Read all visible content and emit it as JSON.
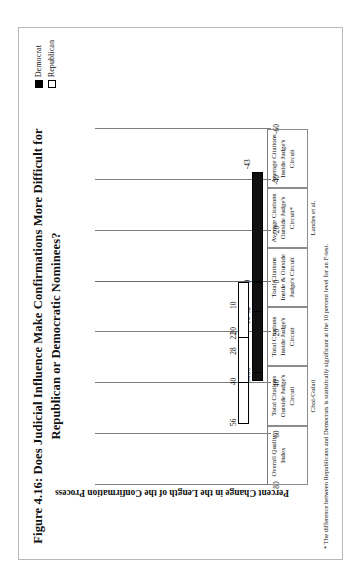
{
  "figure": {
    "title": "Figure 4.16: Does Judicial Influence Make Confirmations More Difficult for Republican or Democratic Nominees?",
    "footnote": "* The difference between Republicans and Democrats is statistically significant at the 10 percent level for an F-test."
  },
  "legend": {
    "items": [
      {
        "label": "Democrat",
        "swatch": "filled-square-icon",
        "color": "#000000"
      },
      {
        "label": "Republican",
        "swatch": "hollow-square-icon",
        "color": "#ffffff"
      }
    ]
  },
  "axis": {
    "ylabel": "Percent Change in the Length of the Confirmation Process",
    "ticks": [
      "80",
      "60",
      "40",
      "20",
      "0",
      "-20",
      "-40",
      "-60"
    ]
  },
  "groups": [
    {
      "label": "Choi-Gulati",
      "span": [
        0,
        2
      ]
    },
    {
      "label": "Landes et al.",
      "span": [
        3,
        5
      ]
    }
  ],
  "chart_data": {
    "type": "bar",
    "orientation": "horizontal-rotated",
    "title": "Figure 4.16: Does Judicial Influence Make Confirmations More Difficult for Republican or Democratic Nominees?",
    "xlabel": "",
    "ylabel": "Percent Change in the Length of the Confirmation Process",
    "ylim": [
      -60,
      80
    ],
    "yticks": [
      80,
      60,
      40,
      20,
      0,
      -20,
      -40,
      -60
    ],
    "grid": true,
    "legend_position": "top-right",
    "categories": [
      "Overall Quality Index",
      "Total Citations Outside Judge's Circuit",
      "Total Citations Inside Judge's Circuit",
      "Total Citations Inside & Outside Judge's Circuit",
      "Average Citations Outside Judge's Circuit*",
      "Average Citations Inside Judge's Circuit"
    ],
    "category_lines": [
      [
        "Overall Quality",
        "Index"
      ],
      [
        "Total Citations",
        "Outside Judge's",
        "Circuit"
      ],
      [
        "Total Citations",
        "Inside Judge's",
        "Circuit"
      ],
      [
        "Total Citations",
        "Inside & Outside",
        "Judge's Circuit"
      ],
      [
        "Average Citations",
        "Outside Judge's",
        "Circuit*"
      ],
      [
        "Average Citations",
        "Inside Judge's",
        "Circuit"
      ]
    ],
    "series": [
      {
        "name": "Democrat",
        "color": "#000000",
        "values": [
          39,
          16,
          36,
          0,
          -43,
          12
        ]
      },
      {
        "name": "Republican",
        "color": "#ffffff",
        "values": [
          56,
          28,
          40,
          10,
          20,
          22
        ]
      }
    ],
    "data_labels": {
      "Democrat": [
        "39",
        "16",
        "36",
        "0",
        "-43",
        "12"
      ],
      "Republican": [
        "56",
        "28",
        "40",
        "10",
        "20",
        "22"
      ]
    },
    "annotations": [
      "* The difference between Republicans and Democrats is statistically significant at the 10 percent level for an F-test."
    ]
  }
}
